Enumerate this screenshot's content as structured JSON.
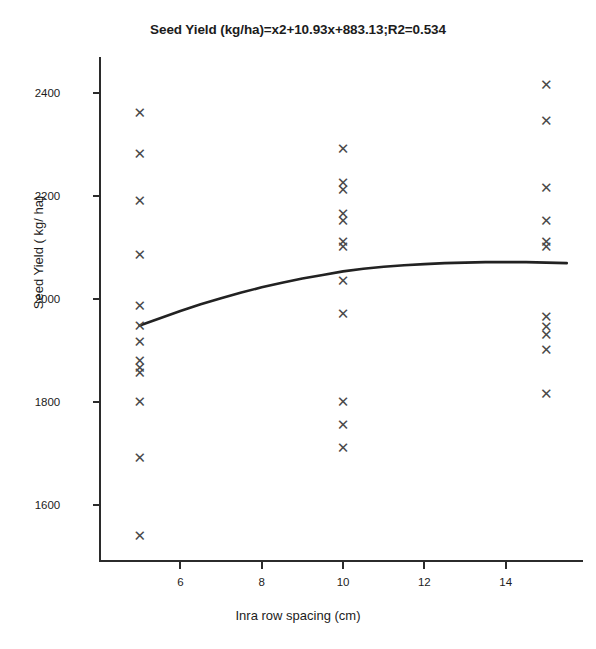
{
  "figure": {
    "width": 596,
    "height": 649,
    "background": "#ffffff",
    "marker_color": "#4a4a4a",
    "axis_color": "#2b2b2b",
    "curve_color": "#222222"
  },
  "chart_data": {
    "type": "scatter",
    "title": "Seed Yield (kg/ha)=x2+10.93x+883.13;R2=0.534",
    "xlabel": "Inra row spacing (cm)",
    "ylabel": "Seed Yield ( kg/ ha)",
    "xlim": [
      4.0,
      15.9
    ],
    "ylim": [
      1490,
      2470
    ],
    "xticks": [
      6,
      8,
      10,
      12,
      14
    ],
    "yticks": [
      1600,
      1800,
      2000,
      2200,
      2400
    ],
    "grid": false,
    "legend": null,
    "marker": "x",
    "series": [
      {
        "name": "Seed yield observations",
        "x": [
          5,
          5,
          5,
          5,
          5,
          5,
          5,
          5,
          5,
          5,
          5,
          5,
          5,
          10,
          10,
          10,
          10,
          10,
          10,
          10,
          10,
          10,
          10,
          10,
          10,
          15,
          15,
          15,
          15,
          15,
          15,
          15,
          15,
          15,
          15,
          15
        ],
        "y": [
          2360,
          2280,
          2190,
          2085,
          1985,
          1947,
          1915,
          1880,
          1865,
          1855,
          1800,
          1690,
          1540,
          2290,
          2225,
          2210,
          2165,
          2150,
          2110,
          2100,
          2035,
          1970,
          1800,
          1755,
          1710,
          2415,
          2345,
          2215,
          2150,
          2110,
          2100,
          1965,
          1945,
          1930,
          1900,
          1815
        ]
      }
    ],
    "fit": {
      "name": "Quadratic fit",
      "equation": "Seed Yield (kg/ha)=x2+10.93x+883.13",
      "r_squared": 0.534,
      "x": [
        5.0,
        5.5,
        6.0,
        6.5,
        7.0,
        7.5,
        8.0,
        8.5,
        9.0,
        9.5,
        10.0,
        10.5,
        11.0,
        11.5,
        12.0,
        12.5,
        13.0,
        13.5,
        14.0,
        14.5,
        15.0,
        15.5
      ],
      "y": [
        1949,
        1963,
        1977,
        1990,
        2002,
        2013,
        2023,
        2032,
        2040,
        2047,
        2054,
        2059,
        2063,
        2066,
        2068,
        2070,
        2071,
        2072,
        2072,
        2072,
        2071,
        2070
      ]
    }
  },
  "axes": {
    "ytick_labels": [
      "2400",
      "2200",
      "2000",
      "1800",
      "1600"
    ],
    "xtick_labels": [
      "6",
      "8",
      "10",
      "12",
      "14"
    ]
  }
}
